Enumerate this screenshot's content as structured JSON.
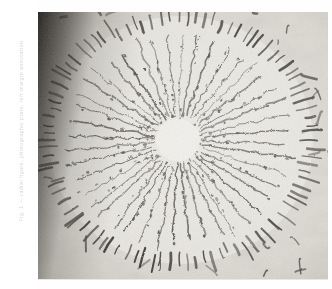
{
  "page": {
    "background_color": "#ffffff",
    "kind": "scanned-photographic-plate"
  },
  "margin": {
    "caption_text": "Fig. 1 — radial figure, photographic plate, left margin annotation",
    "caption_color": "#c8c8c8",
    "orientation": "vertical"
  },
  "plate": {
    "name": "radial-sunburst-drawing",
    "x": 38,
    "y": 12,
    "width": 290,
    "height": 268,
    "paper_color": "#d8d4cc",
    "ink_color": "#2c2824",
    "vignette_color": "#14120f",
    "highlight_color": "#f2efe8"
  },
  "figure": {
    "type": "radial-sunburst",
    "center_x": 140,
    "center_y": 128,
    "core_radius": 22,
    "ray_count": 44,
    "ray_inner_radius": 24,
    "ray_outer_radius_x": 118,
    "ray_outer_radius_y": 108,
    "tick_ring_count": 96,
    "tick_ring_radius_x": 124,
    "tick_ring_radius_y": 114,
    "tick_length": 17,
    "scatter_mark_count": 38
  },
  "chart_data": {
    "type": "scatter",
    "rays": 44,
    "ticks": 96,
    "center": [
      140,
      128
    ],
    "core_radius": 22,
    "ring_radii": [
      118,
      124
    ],
    "xlabel": "",
    "ylabel": "",
    "grid": false,
    "legend": "none"
  }
}
